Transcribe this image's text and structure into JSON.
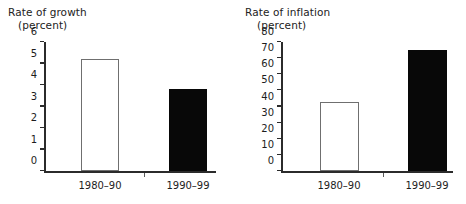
{
  "figure": {
    "background_color": "#ffffff",
    "axis_color": "#2b2b2b",
    "open_bar_fill": "#ffffff",
    "open_bar_stroke": "#6f6f6f",
    "filled_bar_color": "#080808"
  },
  "panels": {
    "growth": {
      "title_main": "Rate of growth",
      "title_sub": "(percent)",
      "tick_labels": [
        "0",
        "1",
        "2",
        "3",
        "4",
        "5",
        "6"
      ],
      "category_labels": [
        "1980–90",
        "1990–99"
      ]
    },
    "inflation": {
      "title_main": "Rate of inflation",
      "title_sub": "(percent)",
      "tick_labels": [
        "0",
        "10",
        "20",
        "30",
        "40",
        "50",
        "60",
        "70",
        "80"
      ],
      "category_labels": [
        "1980–90",
        "1990–99"
      ]
    }
  },
  "chart_data": [
    {
      "type": "bar",
      "title": "Rate of growth",
      "subtitle": "(percent)",
      "xlabel": "",
      "ylabel": "percent",
      "categories": [
        "1980–90",
        "1990–99"
      ],
      "values": [
        5.2,
        3.8
      ],
      "ylim": [
        0,
        6
      ],
      "ytick_step": 1,
      "yticks": [
        0,
        1,
        2,
        3,
        4,
        5,
        6
      ],
      "ytick_labels": [
        "0",
        "1",
        "2",
        "3",
        "4",
        "5",
        "6"
      ],
      "bar_styles": [
        "open",
        "filled"
      ],
      "grid": false,
      "legend": false
    },
    {
      "type": "bar",
      "title": "Rate of inflation",
      "subtitle": "(percent)",
      "xlabel": "",
      "ylabel": "percent",
      "categories": [
        "1980–90",
        "1990–99"
      ],
      "values": [
        43,
        75
      ],
      "ylim": [
        0,
        80
      ],
      "ytick_step": 10,
      "yticks": [
        0,
        10,
        20,
        30,
        40,
        50,
        60,
        70,
        80
      ],
      "ytick_labels": [
        "0",
        "10",
        "20",
        "30",
        "40",
        "50",
        "60",
        "70",
        "80"
      ],
      "bar_styles": [
        "open",
        "filled"
      ],
      "grid": false,
      "legend": false
    }
  ]
}
